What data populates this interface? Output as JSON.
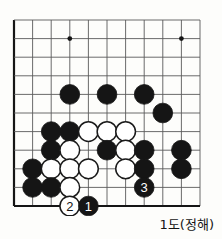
{
  "figure": {
    "kind": "go-problem-diagram",
    "caption": "1도(정해)",
    "board": {
      "cols": 11,
      "rows": 11,
      "origin_x": 14,
      "origin_y": 20,
      "spacing": 18.6,
      "line_color": "#5a5a5a",
      "edge_color": "#1a1a1a",
      "background": "#fdfdfb",
      "star_points": [
        {
          "col": 3,
          "row": 1
        },
        {
          "col": 9,
          "row": 1
        },
        {
          "col": 9,
          "row": 7
        }
      ]
    },
    "colors": {
      "black_stone": "#151515",
      "white_stone": "#ffffff",
      "white_stone_border": "#1a1a1a",
      "black_label_text": "#ffffff",
      "white_label_text": "#151515",
      "caption_text": "#141414"
    },
    "stones": [
      {
        "col": 3,
        "row": 4,
        "color": "black",
        "label": ""
      },
      {
        "col": 5,
        "row": 4,
        "color": "black",
        "label": ""
      },
      {
        "col": 7,
        "row": 4,
        "color": "black",
        "label": ""
      },
      {
        "col": 8,
        "row": 5,
        "color": "black",
        "label": ""
      },
      {
        "col": 2,
        "row": 6,
        "color": "black",
        "label": ""
      },
      {
        "col": 3,
        "row": 6,
        "color": "black",
        "label": ""
      },
      {
        "col": 4,
        "row": 6,
        "color": "white",
        "label": ""
      },
      {
        "col": 5,
        "row": 6,
        "color": "white",
        "label": ""
      },
      {
        "col": 6,
        "row": 6,
        "color": "white",
        "label": ""
      },
      {
        "col": 2,
        "row": 7,
        "color": "black",
        "label": ""
      },
      {
        "col": 3,
        "row": 7,
        "color": "white",
        "label": ""
      },
      {
        "col": 5,
        "row": 7,
        "color": "black",
        "label": ""
      },
      {
        "col": 6,
        "row": 7,
        "color": "white",
        "label": ""
      },
      {
        "col": 7,
        "row": 7,
        "color": "black",
        "label": ""
      },
      {
        "col": 1,
        "row": 8,
        "color": "black",
        "label": ""
      },
      {
        "col": 2,
        "row": 8,
        "color": "white",
        "label": ""
      },
      {
        "col": 3,
        "row": 8,
        "color": "white",
        "label": ""
      },
      {
        "col": 4,
        "row": 8,
        "color": "white",
        "label": ""
      },
      {
        "col": 6,
        "row": 8,
        "color": "white",
        "label": ""
      },
      {
        "col": 7,
        "row": 8,
        "color": "black",
        "label": ""
      },
      {
        "col": 9,
        "row": 7,
        "color": "black",
        "label": ""
      },
      {
        "col": 9,
        "row": 8,
        "color": "black",
        "label": ""
      },
      {
        "col": 1,
        "row": 9,
        "color": "black",
        "label": ""
      },
      {
        "col": 2,
        "row": 9,
        "color": "black",
        "label": ""
      },
      {
        "col": 3,
        "row": 9,
        "color": "white",
        "label": ""
      },
      {
        "col": 7,
        "row": 9,
        "color": "black",
        "label": "3"
      },
      {
        "col": 3,
        "row": 10,
        "color": "white",
        "label": "2"
      },
      {
        "col": 4,
        "row": 10,
        "color": "black",
        "label": "1"
      }
    ]
  }
}
